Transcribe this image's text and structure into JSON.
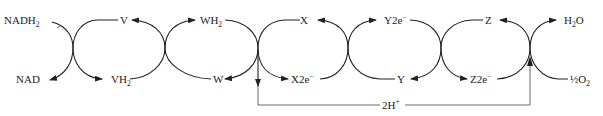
{
  "diagram": {
    "type": "redox-cycle-chain",
    "top_labels": [
      {
        "id": "NADH2",
        "text": "NADH",
        "sub": "2",
        "sup": ""
      },
      {
        "id": "V",
        "text": "V",
        "sub": "",
        "sup": ""
      },
      {
        "id": "WH2",
        "text": "WH",
        "sub": "2",
        "sup": ""
      },
      {
        "id": "X",
        "text": "X",
        "sub": "",
        "sup": ""
      },
      {
        "id": "Y2e",
        "text": "Y2e",
        "sub": "",
        "sup": "−"
      },
      {
        "id": "Z",
        "text": "Z",
        "sub": "",
        "sup": ""
      },
      {
        "id": "H2O",
        "text": "H",
        "sub": "2",
        "tail": "O"
      }
    ],
    "bottom_labels": [
      {
        "id": "NAD",
        "text": "NAD",
        "sub": "",
        "sup": ""
      },
      {
        "id": "VH2",
        "text": "VH",
        "sub": "2",
        "sup": ""
      },
      {
        "id": "W",
        "text": "W",
        "sub": "",
        "sup": ""
      },
      {
        "id": "X2e",
        "text": "X2e",
        "sub": "",
        "sup": "−"
      },
      {
        "id": "Y",
        "text": "Y",
        "sub": "",
        "sup": ""
      },
      {
        "id": "Z2e",
        "text": "Z2e",
        "sub": "",
        "sup": "−"
      },
      {
        "id": "halfO2",
        "text": "½O",
        "sub": "2",
        "sup": ""
      }
    ],
    "proton_label": {
      "text": "2H",
      "sup": "+"
    },
    "nodes": [
      {
        "from": "NADH2",
        "to": "NAD",
        "coupled_from": "V",
        "coupled_to": "VH2"
      },
      {
        "from": "VH2",
        "to": "V",
        "coupled_from": "W",
        "coupled_to": "WH2"
      },
      {
        "from": "WH2",
        "to": "W",
        "coupled_from": "X",
        "coupled_to": "X2e-",
        "releases": "2H+"
      },
      {
        "from": "X2e-",
        "to": "X",
        "coupled_from": "Y",
        "coupled_to": "Y2e-"
      },
      {
        "from": "Y2e-",
        "to": "Y",
        "coupled_from": "Z",
        "coupled_to": "Z2e-"
      },
      {
        "from": "Z2e-",
        "to": "Z",
        "coupled_from": "1/2 O2",
        "coupled_to": "H2O",
        "consumes": "2H+"
      }
    ],
    "colors": {
      "ink": "#222222",
      "background": "#ffffff"
    }
  }
}
